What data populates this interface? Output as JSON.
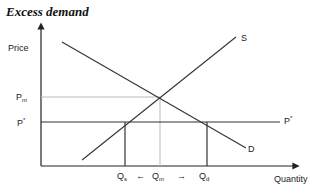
{
  "title": "Excess demand",
  "axes": {
    "y_label": "Price",
    "x_label": "Quantity"
  },
  "price_labels": {
    "pm_main": "P",
    "pm_sub": "m",
    "pstar_main": "P",
    "pstar_sup": "*"
  },
  "curve_labels": {
    "supply": "S",
    "demand": "D",
    "price_ceiling_main": "P",
    "price_ceiling_sup": "*"
  },
  "quantity_labels": {
    "qs_main": "Q",
    "qs_sub": "s",
    "qm_main": "Q",
    "qm_sub": "m",
    "qd_main": "Q",
    "qd_sub": "d",
    "left_arrow": "←",
    "right_arrow": "→"
  },
  "colors": {
    "line": "#333333",
    "guide": "#bbbbbb"
  }
}
